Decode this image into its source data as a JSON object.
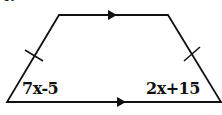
{
  "diagram": {
    "type": "isosceles-trapezoid",
    "question_number": "6.",
    "angles": {
      "bottom_left": "7x-5",
      "bottom_right": "2x+15"
    },
    "markings": {
      "parallel_sides": [
        "top",
        "bottom"
      ],
      "congruent_legs": [
        "left",
        "right"
      ]
    },
    "colors": {
      "stroke": "#111111",
      "background": "#ffffff"
    }
  }
}
